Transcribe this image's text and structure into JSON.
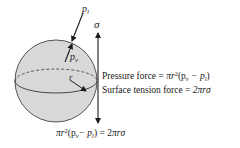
{
  "figure": {
    "colors": {
      "sphere_fill": "#d9d9d9",
      "sphere_stroke": "#555555",
      "ink": "#1a1a1a"
    },
    "labels": {
      "liquid_pressure": "p",
      "liquid_pressure_sub": "l",
      "vapor_pressure": "p",
      "vapor_pressure_sub": "v",
      "surface_tension": "σ",
      "radius": "r"
    },
    "equations": {
      "pressure_force_label": "Pressure force = ",
      "pressure_force_expr_a": "πr",
      "pressure_force_expr_sup": "2",
      "pressure_force_expr_b": "(p",
      "pressure_force_sub_v": "v",
      "pressure_force_minus": " − p",
      "pressure_force_sub_l": "l",
      "pressure_force_close": ")",
      "surface_tension_force_label": "Surface tension force = ",
      "surface_tension_force_expr": "2πrσ",
      "balance_a": "πr",
      "balance_sup": "2",
      "balance_b": "(p",
      "balance_sub_v": "v",
      "balance_minus": "− p",
      "balance_sub_l": "l",
      "balance_c": ") = 2",
      "balance_d": "πrσ"
    }
  }
}
